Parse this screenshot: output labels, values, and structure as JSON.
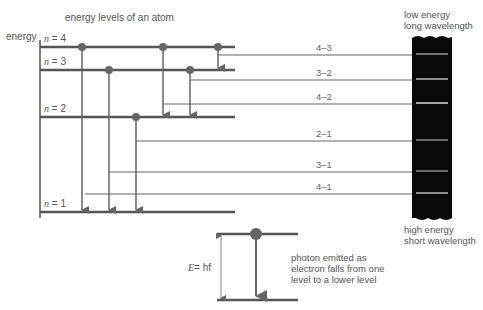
{
  "title": "energy levels of an atom",
  "axis_label": "energy",
  "levels": [
    {
      "n": "4",
      "label": "n = 4",
      "y": 47
    },
    {
      "n": "3",
      "label": "n = 3",
      "y": 70
    },
    {
      "n": "2",
      "label": "n = 2",
      "y": 117
    },
    {
      "n": "1",
      "label": "n = 1",
      "y": 212
    }
  ],
  "transitions": [
    {
      "label": "4–3",
      "y": 55
    },
    {
      "label": "3–2",
      "y": 80
    },
    {
      "label": "4–2",
      "y": 104
    },
    {
      "label": "2–1",
      "y": 141
    },
    {
      "label": "3–1",
      "y": 172
    },
    {
      "label": "4–1",
      "y": 194
    }
  ],
  "spectrum": {
    "top_label_1": "low energy",
    "top_label_2": "long wavelength",
    "bottom_label_1": "high energy",
    "bottom_label_2": "short wavelength"
  },
  "inset": {
    "equation_E": "E",
    "equation_rest": "= hf",
    "caption_1": "photon emitted as",
    "caption_2": "electron falls from one",
    "caption_3": "level to a lower level"
  },
  "colors": {
    "line": "#555555",
    "dot": "#666666",
    "spectrum_bg": "#0a0a0a",
    "spectrum_line": "#bbbbbb"
  }
}
